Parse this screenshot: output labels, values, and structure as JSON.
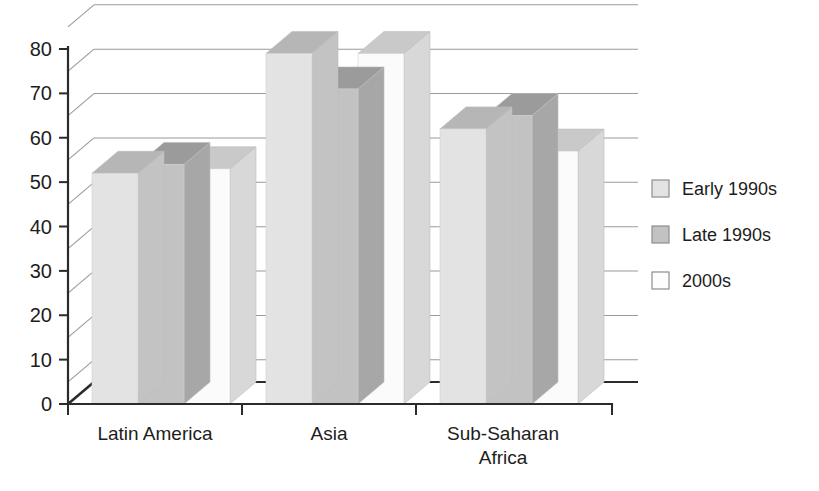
{
  "chart_data": {
    "type": "bar",
    "title": "",
    "subtitle": "",
    "xlabel": "",
    "ylabel": "",
    "categories": [
      "Latin America",
      "Asia",
      "Sub-Saharan Africa"
    ],
    "series": [
      {
        "name": "Early 1990s",
        "values": [
          52,
          79,
          62
        ],
        "color": "#e3e3e3"
      },
      {
        "name": "Late 1990s",
        "values": [
          54,
          71,
          65
        ],
        "color": "#c2c2c2"
      },
      {
        "name": "2000s",
        "values": [
          53,
          79,
          57
        ],
        "color": "#fbfbfb"
      }
    ],
    "ylim": [
      0,
      85
    ],
    "yticks": [
      0,
      10,
      20,
      30,
      40,
      50,
      60,
      70,
      80
    ],
    "ytick_labels": [
      "0",
      "10",
      "20",
      "30",
      "40",
      "50",
      "60",
      "70",
      "80"
    ],
    "grid": true,
    "gridlines_at": [
      5,
      15,
      25,
      35,
      45,
      55,
      65,
      75,
      85
    ],
    "legend_position": "right",
    "style": "3d-grouped-bar"
  },
  "axis": {
    "ticks": [
      {
        "value": 80,
        "label": "80"
      },
      {
        "value": 70,
        "label": "70"
      },
      {
        "value": 60,
        "label": "60"
      },
      {
        "value": 50,
        "label": "50"
      },
      {
        "value": 40,
        "label": "40"
      },
      {
        "value": 30,
        "label": "30"
      },
      {
        "value": 20,
        "label": "20"
      },
      {
        "value": 10,
        "label": "10"
      },
      {
        "value": 0,
        "label": "0"
      }
    ]
  },
  "categories": [
    {
      "line1": "Latin America",
      "line2": ""
    },
    {
      "line1": "Asia",
      "line2": ""
    },
    {
      "line1": "Sub-Saharan",
      "line2": "Africa"
    }
  ],
  "legend": {
    "items": [
      {
        "label": "Early 1990s",
        "color": "#e3e3e3"
      },
      {
        "label": "Late 1990s",
        "color": "#c2c2c2"
      },
      {
        "label": "2000s",
        "color": "#fdfdfd"
      }
    ]
  },
  "colors": {
    "background": "#ffffff",
    "axis": "#2b2b2b",
    "grid": "#9a9a9a",
    "text": "#1d1d1d",
    "series_early": "#e3e3e3",
    "series_late": "#c2c2c2",
    "series_2000s": "#fdfdfd"
  }
}
